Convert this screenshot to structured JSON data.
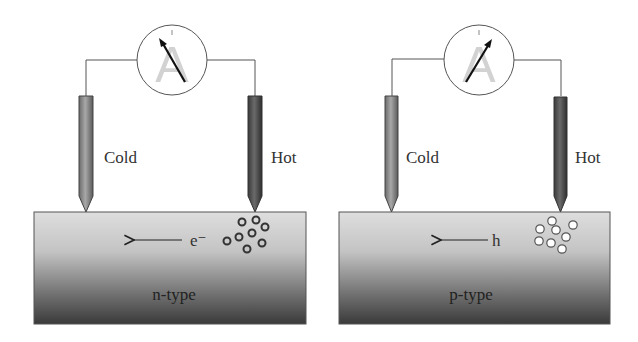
{
  "figure": {
    "panels": [
      {
        "id": "n-type",
        "meter_label": "A",
        "cold_label": "Cold",
        "hot_label": "Hot",
        "carrier_label": "e⁻",
        "material_label": "n-type",
        "carrier_style": "dark-ring",
        "needle_direction": "left"
      },
      {
        "id": "p-type",
        "meter_label": "A",
        "cold_label": "Cold",
        "hot_label": "Hot",
        "carrier_label": "h",
        "material_label": "p-type",
        "carrier_style": "light-ring",
        "needle_direction": "right"
      }
    ]
  },
  "colors": {
    "wire": "#555555",
    "cold_probe": "#8a8a8a",
    "hot_probe": "#4a4a4a",
    "block_top": "#dcdcdc",
    "block_bottom": "#3c3c3c",
    "meter_letter": "#d0d0d0"
  }
}
